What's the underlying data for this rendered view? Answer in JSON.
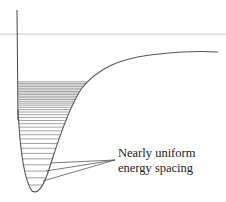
{
  "diagram": {
    "type": "anharmonic-potential-well",
    "annotation": {
      "line1": "Nearly uniform",
      "line2": "energy spacing"
    },
    "colors": {
      "curve": "#555555",
      "levels": "#8a8a8a",
      "reference_line": "#c8c8c8",
      "pointer": "#555555",
      "text": "#222222"
    },
    "level_count": 34
  }
}
